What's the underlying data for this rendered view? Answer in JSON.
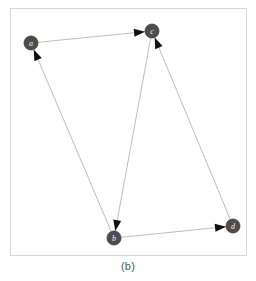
{
  "figure": {
    "caption": "(b)",
    "background_color": "#ffffff",
    "frame_color": "#d8d8d8",
    "node_fill_color": "#4d4d4d",
    "node_stroke_color": "#3a3a3a",
    "node_label_color": "#f2f2f2",
    "edge_color": "#bdbdbd",
    "arrowhead_color": "#111111"
  },
  "chart_data": {
    "type": "diagram",
    "subtype": "directed-graph",
    "title": "(b)",
    "xlabel": "",
    "ylabel": "",
    "grid": false,
    "legend": "none",
    "node_radius": 7,
    "nodes": [
      {
        "id": "a",
        "label": "a",
        "x": 31,
        "y": 43
      },
      {
        "id": "c",
        "label": "c",
        "x": 152,
        "y": 31
      },
      {
        "id": "b",
        "label": "b",
        "x": 114,
        "y": 238
      },
      {
        "id": "d",
        "label": "d",
        "x": 233,
        "y": 226
      }
    ],
    "edges": [
      {
        "from": "a",
        "to": "c",
        "directed": true
      },
      {
        "from": "b",
        "to": "a",
        "directed": true
      },
      {
        "from": "c",
        "to": "b",
        "directed": true
      },
      {
        "from": "d",
        "to": "c",
        "directed": true
      },
      {
        "from": "b",
        "to": "d",
        "directed": true
      }
    ]
  }
}
